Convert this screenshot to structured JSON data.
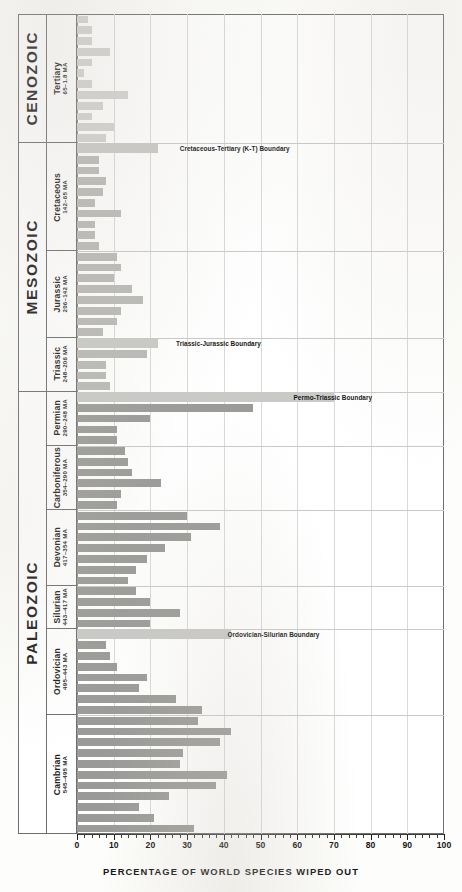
{
  "chart": {
    "title": "PERCENTAGE OF WORLD SPECIES WIPED OUT",
    "axis_min": 0,
    "axis_max": 100,
    "tick_step": 10,
    "tick_labels": [
      "0",
      "10",
      "20",
      "30",
      "40",
      "50",
      "60",
      "70",
      "80",
      "90",
      "100"
    ],
    "bar_color": "#b9b9b7",
    "grid_color": "#d9d9d7",
    "frame_color": "#6e6e6e"
  },
  "eras": [
    {
      "label": "CENOZOIC",
      "shaded": true
    },
    {
      "label": "MESOZOIC",
      "shaded": false
    },
    {
      "label": "PALEOZOIC",
      "shaded": false
    }
  ],
  "periods": [
    {
      "name": "Tertiary",
      "age": "65–1.8 MA"
    },
    {
      "name": "Cretaceous",
      "age": "142–65 MA"
    },
    {
      "name": "Jurassic",
      "age": "206–142 MA"
    },
    {
      "name": "Triassic",
      "age": "248–206 MA"
    },
    {
      "name": "Permian",
      "age": "290–248 MA"
    },
    {
      "name": "Carboniferous",
      "age": "354–290 MA"
    },
    {
      "name": "Devonian",
      "age": "417–354 MA"
    },
    {
      "name": "Silurian",
      "age": "443–417 MA"
    },
    {
      "name": "Ordovician",
      "age": "495–443 MA"
    },
    {
      "name": "Cambrian",
      "age": "545–495 MA"
    }
  ],
  "boundaries": [
    {
      "label": "Cretaceous-Tertiary (K-T) Boundary",
      "value": 22,
      "text_x": 28
    },
    {
      "label": "Triassic-Jurassic Boundary",
      "value": 22,
      "text_x": 27
    },
    {
      "label": "Permo-Triassic Boundary",
      "value": 70,
      "text_x": 59
    },
    {
      "label": "Ordovician-Silurian Boundary",
      "value": 42,
      "text_x": 41
    }
  ],
  "chart_data": {
    "type": "bar",
    "orientation": "horizontal",
    "title": "PERCENTAGE OF WORLD SPECIES WIPED OUT",
    "xlabel": "PERCENTAGE OF WORLD SPECIES WIPED OUT",
    "ylabel": "",
    "xlim": [
      0,
      100
    ],
    "grid": true,
    "legend": "none",
    "note": "Each bar is one geologic stage; value = percentage of world species wiped out. Bars are ordered youngest (top) to oldest (bottom).",
    "categories": [
      "Tertiary s1",
      "Tertiary s2",
      "Tertiary s3",
      "Tertiary s4",
      "Tertiary s5",
      "Tertiary s6",
      "Tertiary s7",
      "Tertiary s8",
      "Tertiary s9",
      "Tertiary s10",
      "Tertiary s11",
      "Tertiary s12",
      "K-T boundary",
      "Cretaceous s1",
      "Cretaceous s2",
      "Cretaceous s3",
      "Cretaceous s4",
      "Cretaceous s5",
      "Cretaceous s6",
      "Cretaceous s7",
      "Cretaceous s8",
      "Cretaceous s9",
      "Jurassic s1",
      "Jurassic s2",
      "Jurassic s3",
      "Jurassic s4",
      "Jurassic s5",
      "Jurassic s6",
      "Jurassic s7",
      "Jurassic s8",
      "T-J boundary",
      "Triassic s1",
      "Triassic s2",
      "Triassic s3",
      "Triassic s4",
      "P-T boundary",
      "Permian s1",
      "Permian s2",
      "Permian s3",
      "Permian s4",
      "Carboniferous s1",
      "Carboniferous s2",
      "Carboniferous s3",
      "Carboniferous s4",
      "Carboniferous s5",
      "Carboniferous s6",
      "Devonian s1",
      "Devonian s2",
      "Devonian s3",
      "Devonian s4",
      "Devonian s5",
      "Devonian s6",
      "Devonian s7",
      "Silurian s1",
      "Silurian s2",
      "Silurian s3",
      "Silurian s4",
      "O-S boundary",
      "Ordovician s1",
      "Ordovician s2",
      "Ordovician s3",
      "Ordovician s4",
      "Ordovician s5",
      "Ordovician s6",
      "Ordovician s7",
      "Cambrian s1",
      "Cambrian s2",
      "Cambrian s3",
      "Cambrian s4",
      "Cambrian s5",
      "Cambrian s6",
      "Cambrian s7",
      "Cambrian s8",
      "Cambrian s9",
      "Cambrian s10",
      "Cambrian s11"
    ],
    "values": [
      3,
      4,
      4,
      9,
      4,
      2,
      4,
      14,
      7,
      4,
      10,
      8,
      22,
      6,
      6,
      8,
      7,
      5,
      12,
      5,
      5,
      6,
      11,
      12,
      10,
      15,
      18,
      12,
      11,
      7,
      22,
      19,
      8,
      8,
      9,
      70,
      48,
      20,
      11,
      11,
      13,
      14,
      15,
      23,
      12,
      11,
      30,
      39,
      31,
      24,
      19,
      16,
      14,
      16,
      20,
      28,
      20,
      42,
      8,
      9,
      11,
      19,
      17,
      27,
      34,
      33,
      42,
      39,
      29,
      28,
      41,
      38,
      25,
      17,
      21,
      32
    ]
  }
}
